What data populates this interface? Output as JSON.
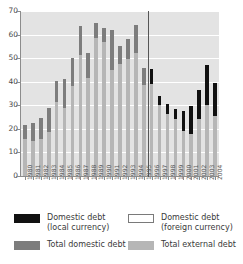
{
  "chart_data": {
    "type": "bar",
    "title": "",
    "xlabel": "",
    "ylabel": "",
    "ylim": [
      0,
      70
    ],
    "yticks": [
      0,
      10,
      20,
      30,
      40,
      50,
      60,
      70
    ],
    "grid": true,
    "legend_position": "bottom",
    "stacked": true,
    "annotations": [
      {
        "name": "period-divider",
        "type": "vline",
        "between": [
          "1995",
          "1996"
        ]
      }
    ],
    "categories": [
      "1980",
      "1981",
      "1982",
      "1983",
      "1984",
      "1985",
      "1986",
      "1987",
      "1988",
      "1989",
      "1990",
      "1991",
      "1992",
      "1993",
      "1994",
      "1995",
      "1996",
      "1997",
      "1998",
      "1999",
      "2000",
      "2001",
      "2002",
      "2003",
      "2004"
    ],
    "series": [
      {
        "name": "Total external debt",
        "color": "#b6b6b6",
        "values": [
          15.5,
          15.0,
          15.5,
          18.5,
          31.5,
          29.0,
          38.0,
          51.5,
          41.5,
          58.5,
          57.0,
          45.0,
          47.5,
          49.5,
          52.0,
          38.5,
          39.0,
          30.0,
          26.5,
          24.0,
          19.0,
          18.0,
          24.0,
          30.0,
          25.5
        ]
      },
      {
        "name": "Total domestic debt",
        "color": "#7d7d7d",
        "values": [
          6.0,
          7.5,
          9.0,
          10.5,
          9.0,
          12.0,
          12.0,
          12.0,
          10.5,
          6.5,
          6.0,
          17.0,
          7.5,
          8.5,
          12.0,
          7.5,
          0,
          0,
          0,
          0,
          0,
          0,
          0,
          0,
          0
        ]
      },
      {
        "name": "Domestic debt (local currency)",
        "color": "#111111",
        "values": [
          0,
          0,
          0,
          0,
          0,
          0,
          0,
          0,
          0,
          0,
          0,
          0,
          0,
          0,
          0,
          0,
          6.5,
          4.0,
          4.0,
          4.5,
          8.5,
          11.5,
          12.5,
          17.0,
          14.0
        ]
      },
      {
        "name": "Domestic debt (foreign currency)",
        "color": "#ffffff",
        "values": [
          0,
          0,
          0,
          0,
          0,
          0,
          0,
          0,
          0,
          0,
          0,
          0,
          0,
          0,
          0,
          0,
          0,
          0,
          0,
          0,
          0,
          0,
          0,
          0,
          0
        ]
      }
    ],
    "totals": [
      21.5,
      22.5,
      24.5,
      29.0,
      40.5,
      41.0,
      50.0,
      63.5,
      52.0,
      65.0,
      63.0,
      62.0,
      55.0,
      58.0,
      64.0,
      46.0,
      45.5,
      34.0,
      30.5,
      28.5,
      27.5,
      29.5,
      36.5,
      47.0,
      39.5
    ]
  },
  "legend": {
    "items": [
      {
        "swatch": "sw-local",
        "line1": "Domestic debt",
        "line2": "(local currency)"
      },
      {
        "swatch": "sw-foreign",
        "line1": "Domestic debt",
        "line2": "(foreign currency)"
      },
      {
        "swatch": "sw-domestic",
        "line1": "Total domestic debt",
        "line2": ""
      },
      {
        "swatch": "sw-external",
        "line1": "Total external debt",
        "line2": ""
      }
    ]
  }
}
